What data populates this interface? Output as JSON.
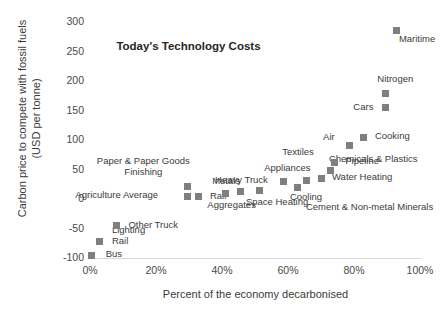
{
  "chart_data": {
    "type": "scatter",
    "title": "Today's Technology Costs",
    "xlabel": "Percent of the economy decarbonised",
    "ylabel": "Carbon price to compete with fossil fuels (USD per tonne)",
    "ylabel_line1": "Carbon price to compete with fossil fuels",
    "ylabel_line2": "(USD per tonne)",
    "xlim": [
      0,
      100
    ],
    "ylim": [
      -100,
      300
    ],
    "xticks": [
      "0%",
      "20%",
      "40%",
      "60%",
      "80%",
      "100%"
    ],
    "xtick_values": [
      0,
      20,
      40,
      60,
      80,
      100
    ],
    "yticks": [
      "-100",
      "-50",
      "0",
      "50",
      "100",
      "150",
      "200",
      "250",
      "300"
    ],
    "ytick_values": [
      -100,
      -50,
      0,
      50,
      100,
      150,
      200,
      250,
      300
    ],
    "grid": false,
    "legend": "none",
    "marker_color": "#7f7f7f",
    "points": [
      {
        "label": "Bus",
        "x": 0.5,
        "y": -95,
        "lx": 14,
        "ly": -2
      },
      {
        "label": "Rail",
        "x": 3.0,
        "y": -72,
        "lx": 12,
        "ly": -1
      },
      {
        "label": "Lighting",
        "x": 3.0,
        "y": -72,
        "lx": 12,
        "ly": -12
      },
      {
        "label": "Other Truck",
        "x": 8.0,
        "y": -45,
        "lx": 12,
        "ly": -2
      },
      {
        "label": "Agriculture Average",
        "x": 29.5,
        "y": 5,
        "lx": -112,
        "ly": -2
      },
      {
        "label": "Paper & Paper Goods Finishing",
        "x": 29.5,
        "y": 22,
        "lx": -92,
        "ly": -26,
        "two_line": true
      },
      {
        "label": "Rail",
        "x": 33.0,
        "y": 4,
        "lx": 11,
        "ly": -2
      },
      {
        "label": "Aggregates",
        "x": 41.0,
        "y": 9,
        "lx": -18,
        "ly": 10
      },
      {
        "label": "Metals",
        "x": 45.5,
        "y": 12,
        "lx": -28,
        "ly": -12
      },
      {
        "label": "Space Heating",
        "x": 51.5,
        "y": 14,
        "lx": -14,
        "ly": 10
      },
      {
        "label": "Heavy Truck",
        "x": 58.5,
        "y": 30,
        "lx": -68,
        "ly": -2
      },
      {
        "label": "Cooling",
        "x": 63.0,
        "y": 20,
        "lx": -8,
        "ly": 9
      },
      {
        "label": "Appliances",
        "x": 65.5,
        "y": 32,
        "lx": -42,
        "ly": -13
      },
      {
        "label": "Cement & Non-metal Minerals",
        "x": 63.0,
        "y": 20,
        "lx": 8,
        "ly": 19
      },
      {
        "label": "Water Heating",
        "x": 70.0,
        "y": 35,
        "lx": 11,
        "ly": -2
      },
      {
        "label": "Chemicals & Plastics",
        "x": 73.0,
        "y": 48,
        "lx": -2,
        "ly": -13
      },
      {
        "label": "Pipeline",
        "x": 74.0,
        "y": 62,
        "lx": 11,
        "ly": -2
      },
      {
        "label": "Textiles",
        "x": 74.0,
        "y": 62,
        "lx": -52,
        "ly": -11
      },
      {
        "label": "Air",
        "x": 78.5,
        "y": 90,
        "lx": -26,
        "ly": -10
      },
      {
        "label": "Cooking",
        "x": 83.0,
        "y": 105,
        "lx": 11,
        "ly": -2
      },
      {
        "label": "Cars",
        "x": 89.5,
        "y": 155,
        "lx": -32,
        "ly": -2
      },
      {
        "label": "Nitrogen",
        "x": 89.5,
        "y": 178,
        "lx": -8,
        "ly": -16
      },
      {
        "label": "Maritime",
        "x": 93.0,
        "y": 285,
        "lx": 2,
        "ly": 7
      }
    ]
  }
}
